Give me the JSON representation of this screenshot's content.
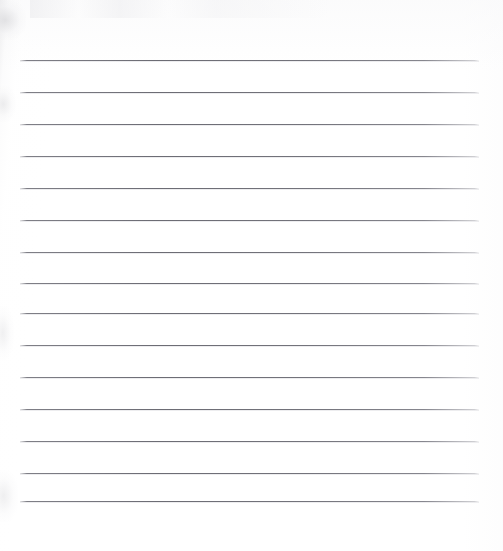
{
  "document": {
    "kind": "scanned-lined-paper",
    "title": "Blank Ruled Paper Scan",
    "description": "A scanned blank sheet of wide-ruled writing paper with no handwriting or printed text.",
    "page_width": 503,
    "page_height": 551,
    "background_color": "#ffffff",
    "paper_tint": "#fefefe"
  },
  "ruling": {
    "line_color": "#6f6f77",
    "line_thickness_px": 1,
    "line_left_px": 20,
    "line_right_px": 479,
    "line_length_px": 459,
    "line_count": 15,
    "first_line_y_px": 60,
    "last_line_y_px": 501,
    "nominal_spacing_px": 32,
    "top_margin_px": 60,
    "bottom_margin_px": 50,
    "lines": [
      {
        "index": 1,
        "y": 60,
        "x1": 20,
        "x2": 479
      },
      {
        "index": 2,
        "y": 92,
        "x1": 20,
        "x2": 479
      },
      {
        "index": 3,
        "y": 124,
        "x1": 20,
        "x2": 479
      },
      {
        "index": 4,
        "y": 156,
        "x1": 20,
        "x2": 479
      },
      {
        "index": 5,
        "y": 188,
        "x1": 20,
        "x2": 479
      },
      {
        "index": 6,
        "y": 220,
        "x1": 20,
        "x2": 479
      },
      {
        "index": 7,
        "y": 252,
        "x1": 20,
        "x2": 479
      },
      {
        "index": 8,
        "y": 283,
        "x1": 20,
        "x2": 479
      },
      {
        "index": 9,
        "y": 313,
        "x1": 20,
        "x2": 479
      },
      {
        "index": 10,
        "y": 345,
        "x1": 20,
        "x2": 479
      },
      {
        "index": 11,
        "y": 377,
        "x1": 20,
        "x2": 479
      },
      {
        "index": 12,
        "y": 409,
        "x1": 20,
        "x2": 479
      },
      {
        "index": 13,
        "y": 441,
        "x1": 20,
        "x2": 479
      },
      {
        "index": 14,
        "y": 473,
        "x1": 20,
        "x2": 479
      },
      {
        "index": 15,
        "y": 501,
        "x1": 20,
        "x2": 479
      }
    ]
  },
  "content": {
    "handwriting": "",
    "printed_text": "",
    "note": "No visible text, marks, or annotations on the page."
  },
  "artifacts": {
    "left_gutter_shading": true,
    "top_edge_speckle": true,
    "scanner_noise_color": "#e4e4e7"
  }
}
